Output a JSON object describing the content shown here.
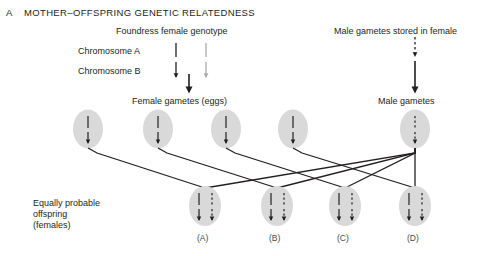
{
  "panel": {
    "letter": "A",
    "title": "MOTHER–OFFSPRING GENETIC RELATEDNESS"
  },
  "headings": {
    "foundress": "Foundress female genotype",
    "male_stored": "Male gametes stored in female",
    "female_gametes": "Female gametes (eggs)",
    "male_gametes": "Male gametes"
  },
  "chromosome_rows": [
    {
      "label": "Chromosome A",
      "marks": [
        "line-dark",
        "line-gray"
      ]
    },
    {
      "label": "Chromosome B",
      "marks": [
        "arrow-dark",
        "arrow-gray"
      ]
    }
  ],
  "offspring_label": {
    "line1": "Equally probable",
    "line2": "offspring",
    "line3": "(females)"
  },
  "female_gametes": [
    {
      "id": "egg-1",
      "cx": 88,
      "cy": 129,
      "marks": [
        "line-dark",
        "arrow-dark"
      ]
    },
    {
      "id": "egg-2",
      "cx": 158,
      "cy": 129,
      "marks": [
        "line-dark",
        "arrow-dark"
      ]
    },
    {
      "id": "egg-3",
      "cx": 226,
      "cy": 129,
      "marks": [
        "line-dark",
        "arrow-dark"
      ]
    },
    {
      "id": "egg-4",
      "cx": 293,
      "cy": 129,
      "marks": [
        "line-dark",
        "arrow-dark"
      ]
    }
  ],
  "male_gamete": {
    "id": "sperm-1",
    "cx": 415,
    "cy": 129,
    "marks": [
      "line-dashed",
      "arrow-dashed"
    ]
  },
  "offspring": [
    {
      "id": "offspring-a",
      "label": "(A)",
      "cx": 205,
      "cy": 206,
      "maternal": [
        "line-dark",
        "arrow-dark"
      ],
      "paternal": [
        "line-dashed",
        "arrow-dashed"
      ]
    },
    {
      "id": "offspring-b",
      "label": "(B)",
      "cx": 277,
      "cy": 206,
      "maternal": [
        "line-dark",
        "arrow-dark"
      ],
      "paternal": [
        "line-dashed",
        "arrow-dashed"
      ]
    },
    {
      "id": "offspring-c",
      "label": "(C)",
      "cx": 345,
      "cy": 206,
      "maternal": [
        "line-dark",
        "arrow-dark"
      ],
      "paternal": [
        "line-dashed",
        "arrow-dashed"
      ]
    },
    {
      "id": "offspring-d",
      "label": "(D)",
      "cx": 415,
      "cy": 206,
      "maternal": [
        "line-dark",
        "arrow-dark"
      ],
      "paternal": [
        "line-dashed",
        "arrow-dashed"
      ]
    }
  ],
  "colors": {
    "ink": "#231f20",
    "gray_mark": "#a9a9a9",
    "cell_fill": "#d9d9d9",
    "background": "#ffffff",
    "case_label": "#4a4a4a"
  }
}
